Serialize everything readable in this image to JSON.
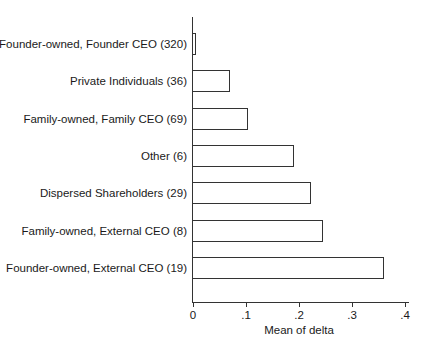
{
  "chart_data": {
    "type": "bar",
    "orientation": "horizontal",
    "title": "",
    "xlabel": "Mean of delta",
    "ylabel": "",
    "xlim": [
      0,
      0.4
    ],
    "xticks": [
      "0",
      ".1",
      ".2",
      ".3",
      ".4"
    ],
    "grid": false,
    "legend": null,
    "categories": [
      "Founder-owned, Founder CEO (320)",
      "Private Individuals (36)",
      "Family-owned, Family CEO (69)",
      "Other (6)",
      "Dispersed Shareholders (29)",
      "Family-owned, External CEO (8)",
      "Founder-owned, External CEO (19)"
    ],
    "values": [
      0.005,
      0.07,
      0.104,
      0.19,
      0.222,
      0.245,
      0.36
    ]
  },
  "colors": {
    "bar_fill": "#ffffff",
    "bar_outline": "#333333",
    "axis": "#333333"
  }
}
